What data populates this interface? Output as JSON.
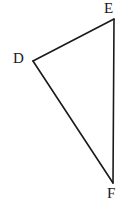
{
  "figure": {
    "kind": "geometry-diagram",
    "shape": "triangle",
    "name": "Triangle DEF",
    "background_color": "#ffffff",
    "stroke_color": "#1a1a1a",
    "stroke_width": 1.6,
    "label_color": "#171717",
    "canvas": {
      "width": 128,
      "height": 204
    },
    "vertices": [
      {
        "id": "D",
        "label": "D",
        "x": 33,
        "y": 61,
        "label_x": 13,
        "label_y": 51,
        "label_position": "left"
      },
      {
        "id": "E",
        "label": "E",
        "x": 114,
        "y": 19,
        "label_x": 104,
        "label_y": 1,
        "label_position": "above"
      },
      {
        "id": "F",
        "label": "F",
        "x": 113,
        "y": 183,
        "label_x": 107,
        "label_y": 186,
        "label_position": "below"
      }
    ],
    "edges": [
      {
        "id": "DE",
        "from": "D",
        "to": "E",
        "points": "33,61 114,19"
      },
      {
        "id": "EF",
        "from": "E",
        "to": "F",
        "points": "114,19 113,183"
      },
      {
        "id": "FD",
        "from": "F",
        "to": "D",
        "points": "113,183 33,61"
      }
    ],
    "polygon_points": "33,61 114,19 113,183"
  }
}
